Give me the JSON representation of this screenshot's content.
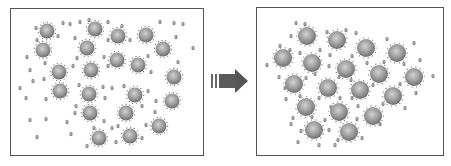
{
  "diagram": {
    "arrow": {
      "direction": "right",
      "color": "#555555"
    },
    "colors": {
      "large_particle": "#8a8a8a",
      "large_particle_highlight": "#d0d0d0",
      "small_particle": "#8e8e8e",
      "frame": "#555555"
    },
    "left_panel": {
      "label": "dispersed state",
      "large_particles": [
        [
          47,
          31
        ],
        [
          95,
          29
        ],
        [
          118,
          36
        ],
        [
          146,
          35
        ],
        [
          43,
          50
        ],
        [
          87,
          48
        ],
        [
          163,
          49
        ],
        [
          117,
          60
        ],
        [
          138,
          65
        ],
        [
          59,
          72
        ],
        [
          91,
          70
        ],
        [
          174,
          77
        ],
        [
          60,
          91
        ],
        [
          89,
          94
        ],
        [
          135,
          95
        ],
        [
          172,
          101
        ],
        [
          90,
          113
        ],
        [
          126,
          113
        ],
        [
          159,
          126
        ],
        [
          99,
          138
        ],
        [
          130,
          136
        ]
      ],
      "small_particles": [
        [
          36,
          28
        ],
        [
          63,
          23
        ],
        [
          70,
          24
        ],
        [
          80,
          22
        ],
        [
          89,
          20
        ],
        [
          108,
          22
        ],
        [
          122,
          26
        ],
        [
          160,
          22
        ],
        [
          174,
          23
        ],
        [
          183,
          24
        ],
        [
          37,
          40
        ],
        [
          58,
          36
        ],
        [
          75,
          38
        ],
        [
          108,
          40
        ],
        [
          130,
          40
        ],
        [
          176,
          37
        ],
        [
          193,
          48
        ],
        [
          27,
          57
        ],
        [
          77,
          58
        ],
        [
          104,
          57
        ],
        [
          119,
          55
        ],
        [
          148,
          56
        ],
        [
          178,
          62
        ],
        [
          30,
          70
        ],
        [
          45,
          63
        ],
        [
          73,
          66
        ],
        [
          108,
          66
        ],
        [
          151,
          72
        ],
        [
          20,
          88
        ],
        [
          33,
          81
        ],
        [
          44,
          79
        ],
        [
          79,
          85
        ],
        [
          103,
          87
        ],
        [
          112,
          88
        ],
        [
          124,
          86
        ],
        [
          148,
          91
        ],
        [
          26,
          98
        ],
        [
          46,
          99
        ],
        [
          76,
          106
        ],
        [
          105,
          98
        ],
        [
          142,
          106
        ],
        [
          156,
          101
        ],
        [
          30,
          120
        ],
        [
          46,
          119
        ],
        [
          67,
          122
        ],
        [
          75,
          113
        ],
        [
          104,
          121
        ],
        [
          155,
          112
        ],
        [
          112,
          128
        ],
        [
          37,
          137
        ],
        [
          71,
          134
        ],
        [
          94,
          128
        ],
        [
          118,
          126
        ],
        [
          146,
          125
        ],
        [
          87,
          146
        ],
        [
          116,
          142
        ],
        [
          142,
          138
        ]
      ]
    },
    "right_panel": {
      "label": "aggregated state",
      "large_particles": [
        [
          307,
          36
        ],
        [
          337,
          40
        ],
        [
          366,
          48
        ],
        [
          397,
          53
        ],
        [
          283,
          58
        ],
        [
          312,
          63
        ],
        [
          346,
          69
        ],
        [
          379,
          74
        ],
        [
          414,
          77
        ],
        [
          294,
          84
        ],
        [
          328,
          88
        ],
        [
          360,
          90
        ],
        [
          393,
          96
        ],
        [
          306,
          107
        ],
        [
          339,
          112
        ],
        [
          373,
          116
        ],
        [
          314,
          130
        ],
        [
          349,
          132
        ]
      ],
      "small_particles": [
        [
          296,
          23
        ],
        [
          305,
          24
        ],
        [
          291,
          36
        ],
        [
          280,
          46
        ],
        [
          327,
          32
        ],
        [
          346,
          30
        ],
        [
          356,
          33
        ],
        [
          387,
          39
        ],
        [
          414,
          43
        ],
        [
          290,
          50
        ],
        [
          300,
          53
        ],
        [
          267,
          65
        ],
        [
          320,
          50
        ],
        [
          330,
          55
        ],
        [
          352,
          56
        ],
        [
          367,
          63
        ],
        [
          384,
          62
        ],
        [
          404,
          64
        ],
        [
          420,
          60
        ],
        [
          433,
          76
        ],
        [
          416,
          93
        ],
        [
          279,
          77
        ],
        [
          285,
          88
        ],
        [
          306,
          78
        ],
        [
          315,
          74
        ],
        [
          339,
          77
        ],
        [
          351,
          80
        ],
        [
          373,
          85
        ],
        [
          400,
          84
        ],
        [
          286,
          99
        ],
        [
          300,
          96
        ],
        [
          319,
          98
        ],
        [
          340,
          98
        ],
        [
          352,
          98
        ],
        [
          383,
          104
        ],
        [
          405,
          108
        ],
        [
          293,
          118
        ],
        [
          325,
          120
        ],
        [
          331,
          107
        ],
        [
          357,
          119
        ],
        [
          380,
          124
        ],
        [
          301,
          131
        ],
        [
          329,
          130
        ],
        [
          338,
          140
        ],
        [
          362,
          138
        ],
        [
          298,
          142
        ],
        [
          319,
          145
        ],
        [
          335,
          145
        ],
        [
          291,
          124
        ],
        [
          312,
          117
        ],
        [
          329,
          66
        ],
        [
          358,
          106
        ]
      ]
    }
  }
}
